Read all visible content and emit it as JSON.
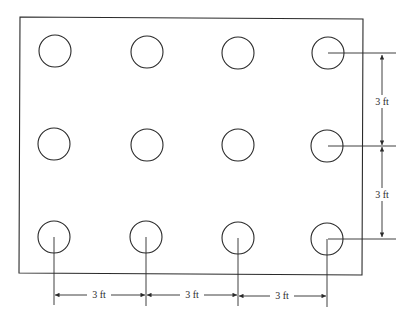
{
  "diagram": {
    "type": "pile-grid-plan",
    "plate": {
      "x1": 20,
      "y1": 17,
      "x2": 363,
      "y2": 275
    },
    "grid": {
      "rows": 3,
      "columns": 4,
      "circle_radius": 16,
      "column_x": [
        55,
        147,
        238,
        328
      ],
      "row_y": [
        51,
        144,
        237
      ]
    },
    "dimensions": {
      "vertical": [
        {
          "label": "3 ft",
          "from_row": 0,
          "to_row": 1
        },
        {
          "label": "3 ft",
          "from_row": 1,
          "to_row": 2
        }
      ],
      "horizontal": [
        {
          "label": "3 ft",
          "from_col": 0,
          "to_col": 1
        },
        {
          "label": "3 ft",
          "from_col": 1,
          "to_col": 2
        },
        {
          "label": "3 ft",
          "from_col": 2,
          "to_col": 3
        }
      ]
    },
    "line_color": "#2a2a2a",
    "background": "#ffffff"
  }
}
